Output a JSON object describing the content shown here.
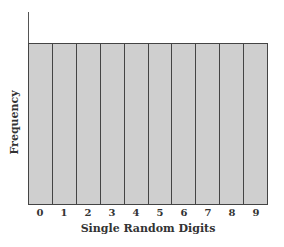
{
  "chart_data": {
    "type": "bar",
    "title": "",
    "xlabel": "Single Random Digits",
    "ylabel": "Frequency",
    "categories": [
      "0",
      "1",
      "2",
      "3",
      "4",
      "5",
      "6",
      "7",
      "8",
      "9"
    ],
    "values": [
      1,
      1,
      1,
      1,
      1,
      1,
      1,
      1,
      1,
      1
    ],
    "ylim": [
      0,
      1.19
    ],
    "y_ticks_shown": false,
    "grid": false,
    "legend": null,
    "colors": {
      "bar_fill": "#cfcfcf",
      "bar_border": "#444444",
      "axis": "#555555"
    },
    "note": "Uniform distribution: all digits have equal frequency; no numeric y-axis scale shown"
  }
}
